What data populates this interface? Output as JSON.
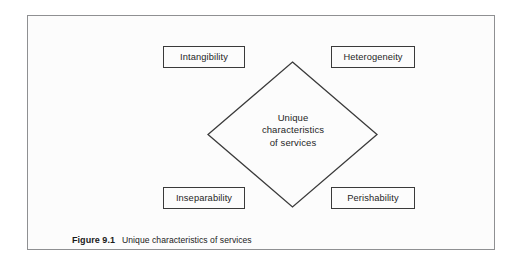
{
  "figure": {
    "caption_label": "Figure 9.1",
    "caption_text": "Unique characteristics of services"
  },
  "diagram": {
    "center": {
      "line1": "Unique",
      "line2": "characteristics",
      "line3": "of services"
    },
    "boxes": [
      {
        "id": "intangibility",
        "label": "Intangibility",
        "position": "top-left"
      },
      {
        "id": "heterogeneity",
        "label": "Heterogeneity",
        "position": "top-right"
      },
      {
        "id": "inseparability",
        "label": "Inseparability",
        "position": "bottom-left"
      },
      {
        "id": "perishability",
        "label": "Perishability",
        "position": "bottom-right"
      }
    ],
    "colors": {
      "frame_border": "#8f9092",
      "box_border": "#3a3a3a",
      "diamond_stroke": "#3a3a3a",
      "panel_background": "#fcfcfc",
      "text": "#1f1f1f"
    }
  }
}
